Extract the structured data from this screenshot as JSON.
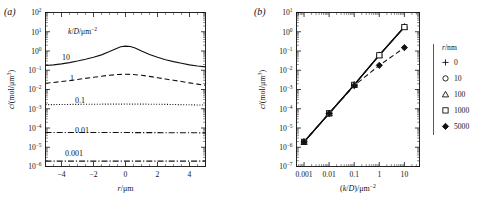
{
  "figure": {
    "panel_a_tag": "(a)",
    "panel_b_tag": "(b)"
  },
  "chart_data": [
    {
      "id": "panel-a",
      "type": "line",
      "title": "",
      "panel_label": "(a)",
      "xlabel": "r/μm",
      "ylabel": "c/(mol/μm³)",
      "xscale": "linear",
      "yscale": "log",
      "xlim": [
        -5,
        5
      ],
      "ylim": [
        1e-06,
        100
      ],
      "xticks": [
        "-4",
        "-2",
        "0",
        "2",
        "4"
      ],
      "xtick_values": [
        -4,
        -2,
        0,
        2,
        4
      ],
      "yticks": [
        "10²",
        "10¹",
        "10⁰",
        "10⁻¹",
        "10⁻²",
        "10⁻³",
        "10⁻⁴",
        "10⁻⁵",
        "10⁻⁶"
      ],
      "ytick_exponents": [
        2,
        1,
        0,
        -1,
        -2,
        -3,
        -4,
        -5,
        -6
      ],
      "grid": false,
      "legend_position": "inside-upper-left",
      "legend_title": "k/D/μm⁻²",
      "inline_labels": [
        "10",
        "1",
        "0.1",
        "0.01",
        "0.001"
      ],
      "series": [
        {
          "name": "10",
          "label": "10",
          "style": "solid",
          "x": [
            -5,
            -4.5,
            -4,
            -3.5,
            -3,
            -2.5,
            -2,
            -1.5,
            -1,
            -0.6,
            -0.3,
            0,
            0.3,
            0.6,
            1,
            1.5,
            2,
            2.5,
            3,
            3.5,
            4,
            4.5,
            5
          ],
          "y": [
            0.175,
            0.19,
            0.215,
            0.25,
            0.3,
            0.37,
            0.47,
            0.63,
            0.93,
            1.3,
            1.65,
            1.8,
            1.72,
            1.45,
            1.0,
            0.66,
            0.47,
            0.35,
            0.28,
            0.23,
            0.19,
            0.165,
            0.15
          ]
        },
        {
          "name": "1",
          "label": "1",
          "style": "dashed",
          "x": [
            -5,
            -4.5,
            -4,
            -3.5,
            -3,
            -2.5,
            -2,
            -1.5,
            -1,
            -0.5,
            0,
            0.5,
            1,
            1.5,
            2,
            2.5,
            3,
            3.5,
            4,
            4.5,
            5
          ],
          "y": [
            0.021,
            0.023,
            0.026,
            0.029,
            0.033,
            0.038,
            0.043,
            0.049,
            0.055,
            0.06,
            0.062,
            0.06,
            0.055,
            0.048,
            0.041,
            0.035,
            0.03,
            0.026,
            0.022,
            0.019,
            0.0165
          ]
        },
        {
          "name": "0.1",
          "label": "0.1",
          "style": "dotted",
          "x": [
            -5,
            -4,
            -3,
            -2,
            -1,
            0,
            1,
            2,
            3,
            4,
            5
          ],
          "y": [
            0.00163,
            0.00166,
            0.00169,
            0.00172,
            0.00174,
            0.00175,
            0.00174,
            0.00171,
            0.00166,
            0.0016,
            0.00155
          ]
        },
        {
          "name": "0.01",
          "label": "0.01",
          "style": "dashdot",
          "x": [
            -5,
            0,
            5
          ],
          "y": [
            5.8e-05,
            5.8e-05,
            5.6e-05
          ]
        },
        {
          "name": "0.001",
          "label": "0.001",
          "style": "dashdot",
          "x": [
            -5,
            0,
            5
          ],
          "y": [
            1.9e-06,
            1.9e-06,
            1.9e-06
          ]
        }
      ]
    },
    {
      "id": "panel-b",
      "type": "scatter",
      "title": "",
      "panel_label": "(b)",
      "xlabel": "(k/D)/μm⁻²",
      "ylabel": "c/(mol/μm³)",
      "xscale": "log",
      "yscale": "log",
      "xlim": [
        0.0005,
        40
      ],
      "ylim": [
        1e-07,
        10
      ],
      "xticks": [
        "0.001",
        "0.01",
        "0.1",
        "1",
        "10"
      ],
      "xtick_values": [
        0.001,
        0.01,
        0.1,
        1,
        10
      ],
      "yticks": [
        "10¹",
        "10⁰",
        "10⁻¹",
        "10⁻²",
        "10⁻³",
        "10⁻⁴",
        "10⁻⁵",
        "10⁻⁶",
        "10⁻⁷"
      ],
      "ytick_exponents": [
        1,
        0,
        -1,
        -2,
        -3,
        -4,
        -5,
        -6,
        -7
      ],
      "grid": false,
      "legend_position": "right-outside",
      "legend_title": "r/nm",
      "x": [
        0.001,
        0.01,
        0.1,
        1,
        10
      ],
      "series": [
        {
          "name": "0",
          "label": "0",
          "marker": "plus",
          "style": "solid",
          "values": [
            1.9e-06,
            5.8e-05,
            0.00175,
            0.062,
            1.8
          ]
        },
        {
          "name": "10",
          "label": "10",
          "marker": "circle",
          "style": "solid",
          "values": [
            1.9e-06,
            5.8e-05,
            0.00175,
            0.062,
            1.8
          ]
        },
        {
          "name": "100",
          "label": "100",
          "marker": "triangle",
          "style": "solid",
          "values": [
            1.9e-06,
            5.8e-05,
            0.00175,
            0.061,
            1.78
          ]
        },
        {
          "name": "1000",
          "label": "1000",
          "marker": "square",
          "style": "solid",
          "values": [
            1.9e-06,
            5.8e-05,
            0.00173,
            0.06,
            1.75
          ]
        },
        {
          "name": "5000",
          "label": "5000",
          "marker": "diamond",
          "style": "dashed",
          "values": [
            1.9e-06,
            5.7e-05,
            0.0016,
            0.018,
            0.15
          ]
        }
      ]
    }
  ]
}
